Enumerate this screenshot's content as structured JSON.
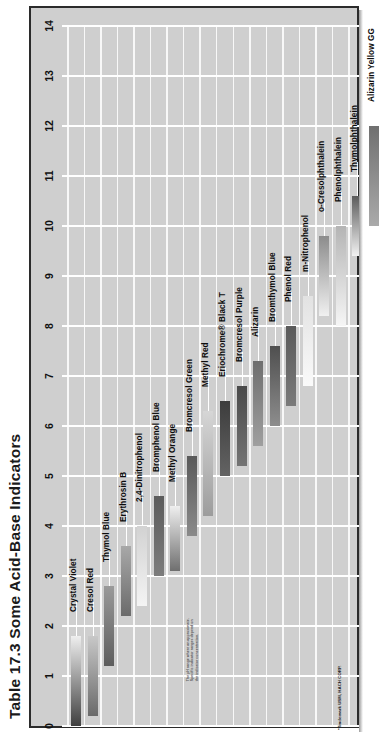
{
  "title": "Table 17.3 Some Acid-Base Indicators",
  "axis": {
    "name": "pH",
    "ticks": [
      "0",
      "1",
      "2",
      "3",
      "4",
      "5",
      "6",
      "7",
      "8",
      "9",
      "10",
      "11",
      "12",
      "13",
      "14"
    ]
  },
  "notes": {
    "body": "The pH range where an approximate. Specific indicator ranges depend on the indicator concentration.",
    "trademark": "*Trademark USM, HACH CORP."
  },
  "colors": {
    "plate_background": "#cfcfcf",
    "grid_line": "#ffffff",
    "frame": "#2b2b2b",
    "text": "#111111"
  },
  "chart_data": {
    "type": "bar",
    "title": "Table 17.3 Some Acid-Base Indicators",
    "xlabel": "Indicator",
    "ylabel": "pH",
    "ylim": [
      0,
      14
    ],
    "grid": true,
    "legend": "none",
    "orientation": "vertical-ranges",
    "categories": [
      "Crystal Violet",
      "Cresol Red",
      "Thymol Blue",
      "Erythrosin B",
      "2,4-Dinitrophenol",
      "Bromphenol Blue",
      "Methyl Orange",
      "Bromcresol Green",
      "Methyl Red",
      "Eriochrome® Black T",
      "Bromcresol Purple",
      "Alizarin",
      "Bromthymol Blue",
      "Phenol Red",
      "m-Nitrophenol",
      "o-Cresolphthalein",
      "Phenolphthalein",
      "Thymolphthalein",
      "Alizarin Yellow GG"
    ],
    "series": [
      {
        "name": "pH transition range",
        "ranges": [
          {
            "indicator": "Crystal Violet",
            "low": 0.0,
            "high": 1.8,
            "acid_color": "#3f3f3f",
            "base_color": "#efefef"
          },
          {
            "indicator": "Cresol Red",
            "low": 0.2,
            "high": 1.8,
            "acid_color": "#6a6a6a",
            "base_color": "#c8c8c8"
          },
          {
            "indicator": "Thymol Blue",
            "low": 1.2,
            "high": 2.8,
            "acid_color": "#5d5d5d",
            "base_color": "#9a9a9a"
          },
          {
            "indicator": "Erythrosin B",
            "low": 2.2,
            "high": 3.6,
            "acid_color": "#6b6b6b",
            "base_color": "#a8a8a8"
          },
          {
            "indicator": "2,4-Dinitrophenol",
            "low": 2.4,
            "high": 4.0,
            "acid_color": "#f4f4f4",
            "base_color": "#d2d2d2"
          },
          {
            "indicator": "Bromphenol Blue",
            "low": 3.0,
            "high": 4.6,
            "acid_color": "#7c7c7c",
            "base_color": "#5c5c5c"
          },
          {
            "indicator": "Methyl Orange",
            "low": 3.1,
            "high": 4.4,
            "acid_color": "#6f6f6f",
            "base_color": "#efefef"
          },
          {
            "indicator": "Bromcresol Green",
            "low": 3.8,
            "high": 5.4,
            "acid_color": "#8a8a8a",
            "base_color": "#5a5a5a"
          },
          {
            "indicator": "Methyl Red",
            "low": 4.2,
            "high": 6.3,
            "acid_color": "#9c9c9c",
            "base_color": "#d6d6d6"
          },
          {
            "indicator": "Eriochrome® Black T",
            "low": 5.0,
            "high": 6.5,
            "acid_color": "#636363",
            "base_color": "#3d3d3d"
          },
          {
            "indicator": "Bromcresol Purple",
            "low": 5.2,
            "high": 6.8,
            "acid_color": "#747474",
            "base_color": "#4a4a4a"
          },
          {
            "indicator": "Alizarin",
            "low": 5.6,
            "high": 7.3,
            "acid_color": "#9f9f9f",
            "base_color": "#6e6e6e"
          },
          {
            "indicator": "Bromthymol Blue",
            "low": 6.0,
            "high": 7.6,
            "acid_color": "#8d8d8d",
            "base_color": "#4f4f4f"
          },
          {
            "indicator": "Phenol Red",
            "low": 6.4,
            "high": 8.0,
            "acid_color": "#7a7a7a",
            "base_color": "#5a5a5a"
          },
          {
            "indicator": "m-Nitrophenol",
            "low": 6.8,
            "high": 8.6,
            "acid_color": "#fafafa",
            "base_color": "#e2e2e2"
          },
          {
            "indicator": "o-Cresolphthalein",
            "low": 8.2,
            "high": 9.8,
            "acid_color": "#f0f0f0",
            "base_color": "#8c8c8c"
          },
          {
            "indicator": "Phenolphthalein",
            "low": 8.0,
            "high": 10.0,
            "acid_color": "#f6f6f6",
            "base_color": "#b4b4b4"
          },
          {
            "indicator": "Thymolphthalein",
            "low": 9.4,
            "high": 10.6,
            "acid_color": "#f2f2f2",
            "base_color": "#5b5b5b"
          },
          {
            "indicator": "Alizarin Yellow GG",
            "low": 10.0,
            "high": 12.0,
            "acid_color": "#aaaaaa",
            "base_color": "#707070"
          }
        ]
      }
    ]
  }
}
